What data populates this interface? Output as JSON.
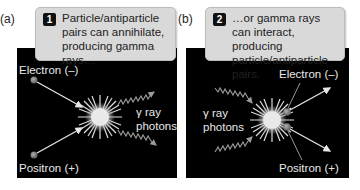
{
  "panels": [
    {
      "label": "(a)",
      "step": "1",
      "caption": "Particle/antiparticle pairs can annihilate, producing gamma rays…",
      "electron_label": "Electron (–)",
      "positron_label": "Positron (+)",
      "photon_label_line1": "γ ray",
      "photon_label_line2": "photons"
    },
    {
      "label": "(b)",
      "step": "2",
      "caption": "…or gamma rays can interact, producing particle/antiparticle pairs.",
      "electron_label": "Electron (–)",
      "positron_label": "Positron (+)",
      "photon_label_line1": "γ ray",
      "photon_label_line2": "photons"
    }
  ],
  "colors": {
    "background": "#000000",
    "callout": "#d9d9d9",
    "particle": "#8a8a8a",
    "arrow": "#e6e6e6"
  }
}
